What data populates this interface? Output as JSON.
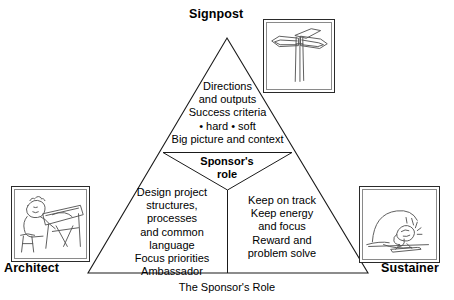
{
  "diagram": {
    "caption": "The Sponsor's Role",
    "corners": [
      {
        "id": "signpost",
        "label": "Signpost",
        "icon": "signpost-drawing-icon"
      },
      {
        "id": "architect",
        "label": "Architect",
        "icon": "architect-at-drafting-table-icon"
      },
      {
        "id": "sustainer",
        "label": "Sustainer",
        "icon": "person-pushing-load-uphill-icon"
      }
    ],
    "center_label": "Sponsor's\nrole",
    "center_label_lines": [
      "Sponsor's",
      "role"
    ],
    "sections": {
      "top": {
        "name": "signpost-section",
        "lines": [
          "Directions",
          "and outputs",
          "Success criteria",
          "• hard • soft",
          "Big picture and context"
        ],
        "text": "Directions\nand outputs\nSuccess criteria\n• hard • soft\nBig picture and context"
      },
      "left": {
        "name": "architect-section",
        "lines": [
          "Design project",
          "structures,",
          "processes",
          "and common",
          "language",
          "Focus priorities",
          "Ambassador"
        ],
        "text": "Design project\nstructures,\nprocesses\nand common\nlanguage\nFocus priorities\nAmbassador"
      },
      "right": {
        "name": "sustainer-section",
        "lines": [
          "Keep on track",
          "Keep energy",
          "and focus",
          "Reward and",
          "problem solve"
        ],
        "text": "Keep on track\nKeep energy\nand focus\nReward and\nproblem solve"
      }
    },
    "colors": {
      "stroke": "#1a1a1a",
      "text": "#000000",
      "background": "#ffffff",
      "frame_border": "#2a2a2a",
      "frame_inner_border": "#8a8a8a",
      "sketch": "#555555"
    }
  }
}
